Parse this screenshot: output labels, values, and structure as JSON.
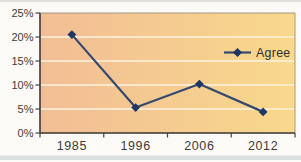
{
  "chart_data": {
    "type": "line",
    "title": "",
    "xlabel": "",
    "ylabel": "",
    "categories": [
      "1985",
      "1996",
      "2006",
      "2012"
    ],
    "series": [
      {
        "name": "Agree",
        "values": [
          20.5,
          5.3,
          10.2,
          4.4
        ],
        "marker": "diamond"
      }
    ],
    "ylim": [
      0,
      25
    ],
    "y_tick_step": 5,
    "y_tick_labels": [
      "0%",
      "5%",
      "10%",
      "15%",
      "20%",
      "25%"
    ],
    "grid": true,
    "legend": {
      "label": "Agree",
      "marker": "diamond",
      "position": "inside-right"
    },
    "colors": {
      "line": "#33496e",
      "marker": "#1f3765",
      "plot_background_left": "#f2bd95",
      "plot_background_right": "#f8d98c",
      "gridline": "#fdf2e0",
      "axis": "#46423b",
      "tick_text": "#3d3b38",
      "legend_text": "#2e2e2e",
      "page_background": "#fcfaf6"
    }
  }
}
